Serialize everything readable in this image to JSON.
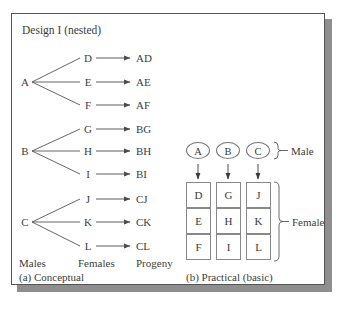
{
  "figure": {
    "title": "Design I (nested)",
    "panel_a": {
      "caption": "(a) Conceptual",
      "column_headers": [
        "Males",
        "Females",
        "Progeny"
      ],
      "groups": [
        {
          "male": "A",
          "rows": [
            {
              "female": "D",
              "progeny": "AD"
            },
            {
              "female": "E",
              "progeny": "AE"
            },
            {
              "female": "F",
              "progeny": "AF"
            }
          ]
        },
        {
          "male": "B",
          "rows": [
            {
              "female": "G",
              "progeny": "BG"
            },
            {
              "female": "H",
              "progeny": "BH"
            },
            {
              "female": "I",
              "progeny": "BI"
            }
          ]
        },
        {
          "male": "C",
          "rows": [
            {
              "female": "J",
              "progeny": "CJ"
            },
            {
              "female": "K",
              "progeny": "CK"
            },
            {
              "female": "L",
              "progeny": "CL"
            }
          ]
        }
      ]
    },
    "panel_b": {
      "caption": "(b) Practical (basic)",
      "male_label": "Male",
      "female_label": "Female",
      "male_nodes": [
        "A",
        "B",
        "C"
      ],
      "female_columns": [
        [
          "D",
          "E",
          "F"
        ],
        [
          "G",
          "H",
          "I"
        ],
        [
          "J",
          "K",
          "L"
        ]
      ]
    },
    "colors": {
      "frame_line": "#555555",
      "shadow": "#8e8e8e",
      "text": "#3d3d3d",
      "connector": "#555555",
      "box_border": "#888888",
      "background": "#ffffff"
    }
  }
}
